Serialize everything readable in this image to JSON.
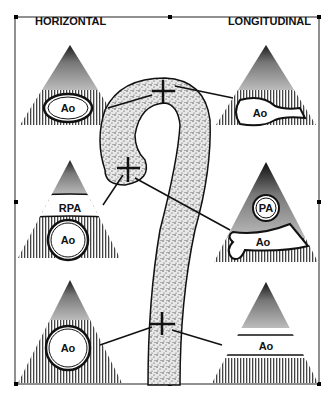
{
  "headers": {
    "left": "HORIZONTAL",
    "right": "LONGITUDINAL"
  },
  "panels": {
    "horizontal": [
      {
        "position": "top",
        "labels": [
          "Ao"
        ]
      },
      {
        "position": "middle",
        "labels": [
          "RPA",
          "Ao"
        ]
      },
      {
        "position": "bottom",
        "labels": [
          "Ao"
        ]
      }
    ],
    "longitudinal": [
      {
        "position": "top",
        "labels": [
          "Ao"
        ]
      },
      {
        "position": "middle",
        "labels": [
          "PA",
          "Ao"
        ]
      },
      {
        "position": "bottom",
        "labels": [
          "Ao"
        ]
      }
    ]
  },
  "center_figure": "aortic arch with three cross-hair marker positions"
}
